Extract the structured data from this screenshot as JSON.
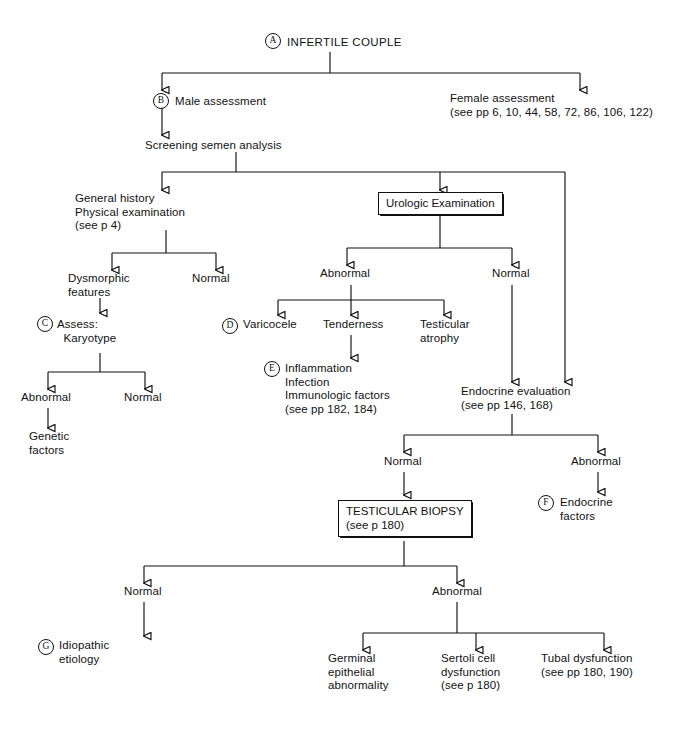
{
  "diagram": {
    "line_color": "#111111",
    "background": "#ffffff"
  },
  "labels": {
    "a_marker": "A",
    "b_marker": "B",
    "c_marker": "C",
    "d_marker": "D",
    "e_marker": "E",
    "f_marker": "F",
    "g_marker": "G",
    "root": "INFERTILE COUPLE",
    "male_assessment": "Male assessment",
    "female_assessment": "Female assessment\n(see pp 6, 10, 44, 58, 72, 86, 106, 122)",
    "screening_semen": "Screening semen analysis",
    "general_history": "General history\nPhysical examination\n(see p 4)",
    "urologic_exam": "Urologic Examination",
    "dysmorphic": "Dysmorphic\nfeatures",
    "normal_hist": "Normal",
    "assess_karyotype": "Assess:\n  Karyotype",
    "abnormal_uro": "Abnormal",
    "normal_uro": "Normal",
    "abnormal_karyo": "Abnormal",
    "normal_karyo": "Normal",
    "genetic_factors": "Genetic\nfactors",
    "varicocele": "Varicocele",
    "tenderness": "Tenderness",
    "testicular_atrophy": "Testicular\natrophy",
    "inflammation": "Inflammation\nInfection\nImmunologic factors\n(see pp 182, 184)",
    "endocrine_eval": "Endocrine evaluation\n(see pp 146, 168)",
    "normal_endo": "Normal",
    "abnormal_endo": "Abnormal",
    "endocrine_factors": "Endocrine\nfactors",
    "testicular_biopsy": "TESTICULAR BIOPSY\n(see p 180)",
    "normal_biopsy": "Normal",
    "abnormal_biopsy": "Abnormal",
    "idiopathic": "Idiopathic\netiology",
    "germinal": "Germinal\nepithelial\nabnormality",
    "sertoli": "Sertoli cell\ndysfunction\n(see p 180)",
    "tubal": "Tubal dysfunction\n(see pp 180, 190)"
  }
}
